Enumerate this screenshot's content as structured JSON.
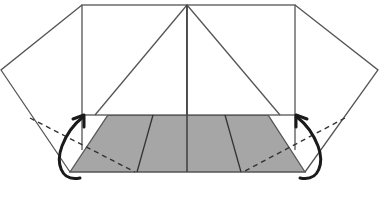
{
  "diagram": {
    "type": "origami-fold-step",
    "colors": {
      "background": "#ffffff",
      "line": "#555555",
      "shaded_face": "#a6a6a6",
      "arrow": "#1a1a1a"
    },
    "top_squares": {
      "left": {
        "x1": 82,
        "x2": 187,
        "y1": 5,
        "y2": 115,
        "diagonal": [
          [
            187,
            5
          ],
          [
            95,
            115
          ]
        ]
      },
      "right": {
        "x1": 187,
        "x2": 295,
        "y1": 5,
        "y2": 115,
        "diagonal": [
          [
            187,
            5
          ],
          [
            280,
            115
          ]
        ]
      }
    },
    "center_line": [
      [
        187,
        5
      ],
      [
        187,
        172
      ]
    ],
    "shaded_trapezoid": [
      [
        108,
        115
      ],
      [
        268,
        115
      ],
      [
        305,
        172
      ],
      [
        70,
        172
      ]
    ],
    "inner_creases": [
      [
        [
          153,
          115
        ],
        [
          137,
          172
        ]
      ],
      [
        [
          225,
          115
        ],
        [
          241,
          172
        ]
      ]
    ],
    "left_flap": [
      [
        82,
        5
      ],
      [
        1,
        70
      ],
      [
        70,
        172
      ]
    ],
    "right_flap": [
      [
        295,
        5
      ],
      [
        378,
        70
      ],
      [
        305,
        172
      ]
    ],
    "fold_lines_dashed": [
      [
        [
          30,
          118
        ],
        [
          135,
          172
        ]
      ],
      [
        [
          345,
          118
        ],
        [
          243,
          172
        ]
      ]
    ],
    "arrows": [
      {
        "name": "left-fold-arrow",
        "direction": "up",
        "path": "M 80 178 C 60 178, 55 160, 62 145 C 68 132, 75 124, 84 115"
      },
      {
        "name": "right-fold-arrow",
        "direction": "up",
        "path": "M 300 178 C 320 178, 325 160, 318 145 C 312 132, 305 124, 296 115"
      }
    ]
  }
}
